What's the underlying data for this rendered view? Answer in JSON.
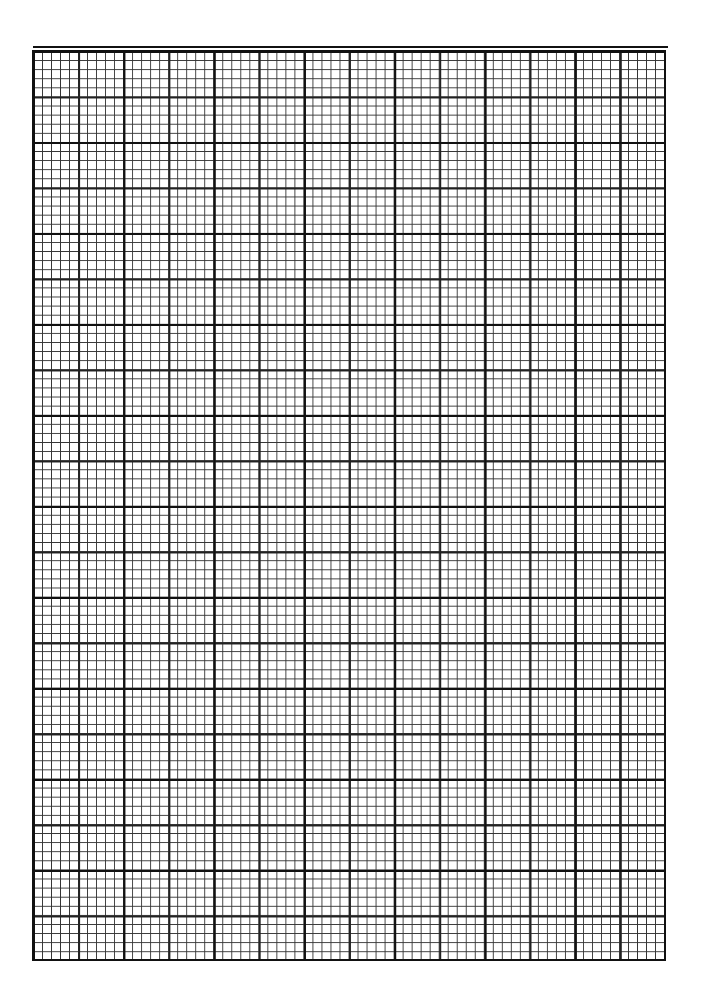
{
  "page": {
    "type": "graph-paper",
    "grid": {
      "major_columns": 7,
      "major_rows": 10,
      "minor_per_major": 10,
      "medium_every": 5,
      "line_color": "#111111",
      "background": "#ffffff"
    }
  }
}
